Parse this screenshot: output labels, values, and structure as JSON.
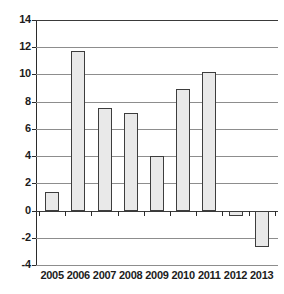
{
  "chart_data": {
    "type": "bar",
    "title": "",
    "subtitle": "",
    "xlabel": "",
    "ylabel": "",
    "categories": [
      "2005",
      "2006",
      "2007",
      "2008",
      "2009",
      "2010",
      "2011",
      "2012",
      "2013"
    ],
    "values": [
      1.4,
      11.7,
      7.5,
      7.2,
      4.0,
      8.9,
      10.15,
      -0.4,
      -2.7
    ],
    "ylim": [
      -4,
      14
    ],
    "ytick_step": 2,
    "yticks": [
      "14",
      "12",
      "10",
      "8",
      "6",
      "4",
      "2",
      "0",
      "-2",
      "-4"
    ],
    "ytick_values": [
      14,
      12,
      10,
      8,
      6,
      4,
      2,
      0,
      -2,
      -4
    ],
    "grid": true,
    "legend": false,
    "legend_position": "none",
    "bar_fill_color": "#e9e9e9",
    "bar_border_color": "#3d3d3d",
    "gridline_color": "#8d8d8d",
    "axis_color": "#2b2b2b",
    "background_color": "#ffffff"
  }
}
